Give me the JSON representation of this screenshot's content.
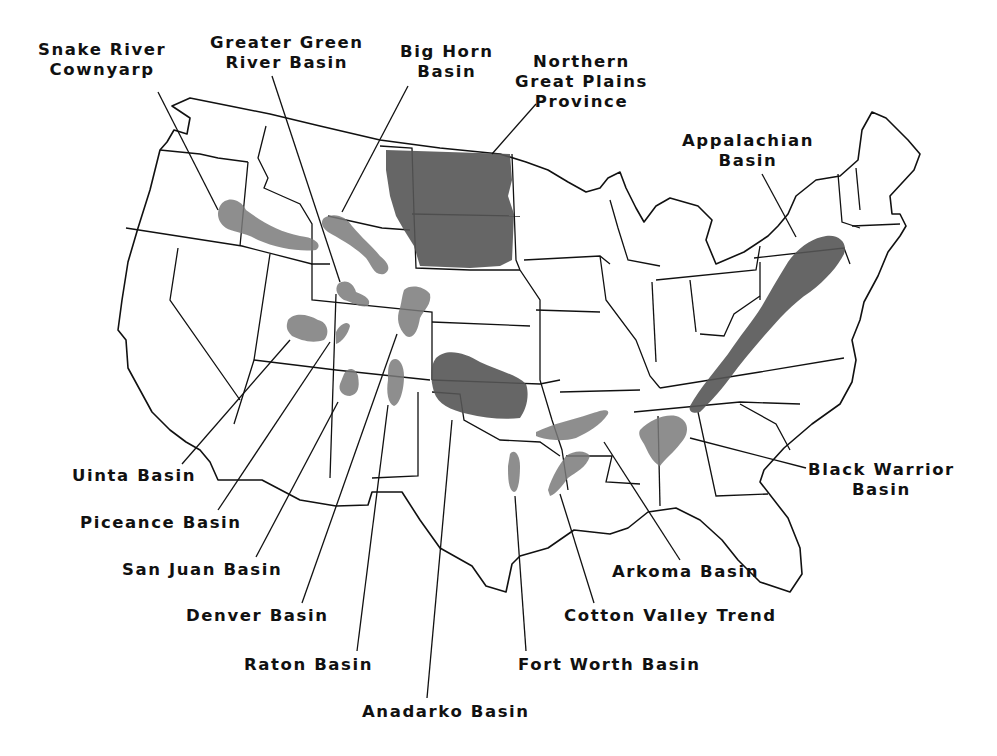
{
  "map": {
    "title": "",
    "region": "Conterminous United States",
    "shade_color": "#7a7a7a",
    "shade_dark_color": "#555555",
    "outline_color": "#111111",
    "background": "#ffffff"
  },
  "labels": [
    {
      "id": "snake-river",
      "lines": [
        "Snake River",
        "Cownyarp"
      ],
      "x": 38,
      "y": 40,
      "leader": [
        [
          158,
          92
        ],
        [
          218,
          210
        ]
      ]
    },
    {
      "id": "greater-green-river",
      "lines": [
        "Greater Green",
        "River Basin"
      ],
      "x": 210,
      "y": 33,
      "leader": [
        [
          272,
          76
        ],
        [
          340,
          282
        ]
      ]
    },
    {
      "id": "big-horn",
      "lines": [
        "Big Horn",
        "Basin"
      ],
      "x": 400,
      "y": 42,
      "leader": [
        [
          408,
          86
        ],
        [
          342,
          212
        ]
      ]
    },
    {
      "id": "northern-great-plains",
      "lines": [
        "Northern",
        "Great Plains",
        "Province"
      ],
      "x": 515,
      "y": 52,
      "leader": [
        [
          536,
          104
        ],
        [
          492,
          154
        ]
      ]
    },
    {
      "id": "appalachian",
      "lines": [
        "Appalachian",
        "Basin"
      ],
      "x": 682,
      "y": 131,
      "leader": [
        [
          762,
          174
        ],
        [
          796,
          237
        ]
      ]
    },
    {
      "id": "black-warrior",
      "lines": [
        "Black Warrior",
        "Basin"
      ],
      "x": 808,
      "y": 460,
      "leader": [
        [
          806,
          468
        ],
        [
          690,
          438
        ]
      ]
    },
    {
      "id": "uinta",
      "lines": [
        "Uinta Basin"
      ],
      "x": 72,
      "y": 466,
      "leader": [
        [
          182,
          464
        ],
        [
          290,
          340
        ]
      ]
    },
    {
      "id": "piceance",
      "lines": [
        "Piceance Basin"
      ],
      "x": 80,
      "y": 513,
      "leader": [
        [
          218,
          510
        ],
        [
          330,
          342
        ]
      ]
    },
    {
      "id": "san-juan",
      "lines": [
        "San Juan Basin"
      ],
      "x": 122,
      "y": 560,
      "leader": [
        [
          256,
          557
        ],
        [
          338,
          402
        ]
      ]
    },
    {
      "id": "denver",
      "lines": [
        "Denver Basin"
      ],
      "x": 186,
      "y": 606,
      "leader": [
        [
          302,
          603
        ],
        [
          397,
          334
        ]
      ]
    },
    {
      "id": "raton",
      "lines": [
        "Raton Basin"
      ],
      "x": 244,
      "y": 655,
      "leader": [
        [
          357,
          651
        ],
        [
          388,
          405
        ]
      ]
    },
    {
      "id": "anadarko",
      "lines": [
        "Anadarko Basin"
      ],
      "x": 362,
      "y": 702,
      "leader": [
        [
          427,
          698
        ],
        [
          452,
          420
        ]
      ]
    },
    {
      "id": "fort-worth",
      "lines": [
        "Fort Worth Basin"
      ],
      "x": 518,
      "y": 655,
      "leader": [
        [
          526,
          651
        ],
        [
          515,
          496
        ]
      ]
    },
    {
      "id": "cotton-valley",
      "lines": [
        "Cotton Valley Trend"
      ],
      "x": 564,
      "y": 606,
      "leader": [
        [
          594,
          603
        ],
        [
          560,
          494
        ]
      ]
    },
    {
      "id": "arkoma",
      "lines": [
        "Arkoma Basin"
      ],
      "x": 612,
      "y": 562,
      "leader": [
        [
          680,
          560
        ],
        [
          604,
          442
        ]
      ]
    }
  ]
}
